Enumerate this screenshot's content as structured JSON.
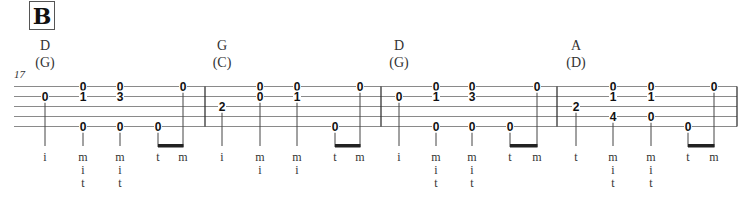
{
  "section_label": "B",
  "measure_number": "17",
  "string_count": 5,
  "measures": [
    {
      "chord": "D",
      "capo_chord": "(G)",
      "events": [
        {
          "notes": [
            {
              "string": 2,
              "fret": "0"
            }
          ],
          "fingers": [
            "i"
          ]
        },
        {
          "notes": [
            {
              "string": 1,
              "fret": "0"
            },
            {
              "string": 2,
              "fret": "1"
            },
            {
              "string": 5,
              "fret": "0"
            }
          ],
          "fingers": [
            "m",
            "i",
            "t"
          ]
        },
        {
          "notes": [
            {
              "string": 1,
              "fret": "0"
            },
            {
              "string": 2,
              "fret": "3"
            },
            {
              "string": 5,
              "fret": "0"
            }
          ],
          "fingers": [
            "m",
            "i",
            "t"
          ]
        },
        {
          "notes": [
            {
              "string": 5,
              "fret": "0"
            }
          ],
          "fingers": [
            "t"
          ],
          "beam": "start"
        },
        {
          "notes": [
            {
              "string": 1,
              "fret": "0"
            }
          ],
          "fingers": [
            "m"
          ],
          "beam": "end"
        }
      ]
    },
    {
      "chord": "G",
      "capo_chord": "(C)",
      "events": [
        {
          "notes": [
            {
              "string": 3,
              "fret": "2"
            }
          ],
          "fingers": [
            "i"
          ]
        },
        {
          "notes": [
            {
              "string": 1,
              "fret": "0"
            },
            {
              "string": 2,
              "fret": "0"
            }
          ],
          "fingers": [
            "m",
            "i"
          ]
        },
        {
          "notes": [
            {
              "string": 1,
              "fret": "0"
            },
            {
              "string": 2,
              "fret": "1"
            }
          ],
          "fingers": [
            "m",
            "i"
          ]
        },
        {
          "notes": [
            {
              "string": 5,
              "fret": "0"
            }
          ],
          "fingers": [
            "t"
          ],
          "beam": "start"
        },
        {
          "notes": [
            {
              "string": 1,
              "fret": "0"
            }
          ],
          "fingers": [
            "m"
          ],
          "beam": "end"
        }
      ]
    },
    {
      "chord": "D",
      "capo_chord": "(G)",
      "events": [
        {
          "notes": [
            {
              "string": 2,
              "fret": "0"
            }
          ],
          "fingers": [
            "i"
          ]
        },
        {
          "notes": [
            {
              "string": 1,
              "fret": "0"
            },
            {
              "string": 2,
              "fret": "1"
            },
            {
              "string": 5,
              "fret": "0"
            }
          ],
          "fingers": [
            "m",
            "i",
            "t"
          ]
        },
        {
          "notes": [
            {
              "string": 1,
              "fret": "0"
            },
            {
              "string": 2,
              "fret": "3"
            },
            {
              "string": 5,
              "fret": "0"
            }
          ],
          "fingers": [
            "m",
            "i",
            "t"
          ]
        },
        {
          "notes": [
            {
              "string": 5,
              "fret": "0"
            }
          ],
          "fingers": [
            "t"
          ],
          "beam": "start"
        },
        {
          "notes": [
            {
              "string": 1,
              "fret": "0"
            }
          ],
          "fingers": [
            "m"
          ],
          "beam": "end"
        }
      ]
    },
    {
      "chord": "A",
      "capo_chord": "(D)",
      "events": [
        {
          "notes": [
            {
              "string": 3,
              "fret": "2"
            }
          ],
          "fingers": [
            "t"
          ]
        },
        {
          "notes": [
            {
              "string": 1,
              "fret": "0"
            },
            {
              "string": 2,
              "fret": "1"
            },
            {
              "string": 4,
              "fret": "4"
            }
          ],
          "fingers": [
            "m",
            "i",
            "t"
          ]
        },
        {
          "notes": [
            {
              "string": 1,
              "fret": "0"
            },
            {
              "string": 2,
              "fret": "1"
            },
            {
              "string": 4,
              "fret": "0"
            }
          ],
          "fingers": [
            "m",
            "i",
            "t"
          ]
        },
        {
          "notes": [
            {
              "string": 5,
              "fret": "0"
            }
          ],
          "fingers": [
            "t"
          ],
          "beam": "start"
        },
        {
          "notes": [
            {
              "string": 1,
              "fret": "0"
            }
          ],
          "fingers": [
            "m"
          ],
          "beam": "end"
        }
      ]
    }
  ]
}
